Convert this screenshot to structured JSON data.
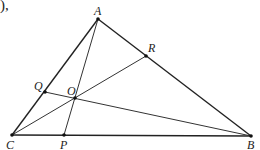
{
  "fragment_text": "),",
  "diagram": {
    "type": "triangle-with-concurrent-cevians",
    "points": {
      "A": {
        "label": "A",
        "x": 98,
        "y": 19
      },
      "B": {
        "label": "B",
        "x": 251,
        "y": 136
      },
      "C": {
        "label": "C",
        "x": 12,
        "y": 135
      },
      "P": {
        "label": "P",
        "x": 64,
        "y": 135
      },
      "Q": {
        "label": "Q",
        "x": 45,
        "y": 92
      },
      "R": {
        "label": "R",
        "x": 146,
        "y": 56
      },
      "O": {
        "label": "O",
        "x": 75,
        "y": 98
      }
    },
    "segments": [
      [
        "A",
        "B"
      ],
      [
        "B",
        "C"
      ],
      [
        "C",
        "A"
      ],
      [
        "A",
        "P"
      ],
      [
        "C",
        "R"
      ],
      [
        "B",
        "Q"
      ]
    ],
    "labels": {
      "A": "A",
      "B": "B",
      "C": "C",
      "P": "P",
      "Q": "Q",
      "R": "R",
      "O": "O"
    }
  }
}
